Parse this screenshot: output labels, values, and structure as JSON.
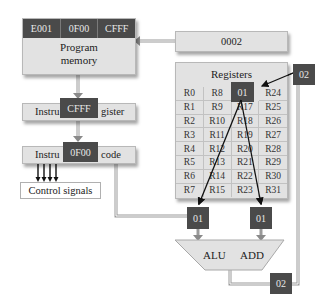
{
  "program_memory": {
    "cells": [
      "E001",
      "0F00",
      "CFFF"
    ],
    "label_line1": "Program",
    "label_line2": "memory"
  },
  "program_counter": {
    "value": "0002"
  },
  "instruction_register": {
    "label_left": "Instru",
    "label_right": "gister",
    "value": "CFFF"
  },
  "instruction_decode": {
    "label_left": "Instru",
    "label_right": "code",
    "value": "0F00"
  },
  "control_signals": {
    "label": "Control signals"
  },
  "registers": {
    "title": "Registers",
    "cells": [
      "R0",
      "R8",
      "01",
      "R24",
      "R1",
      "R9",
      "R17",
      "R25",
      "R2",
      "R10",
      "R18",
      "R26",
      "R3",
      "R11",
      "R19",
      "R27",
      "R4",
      "R12",
      "R20",
      "R28",
      "R5",
      "R13",
      "R21",
      "R29",
      "R6",
      "R14",
      "R22",
      "R30",
      "R7",
      "R15",
      "R23",
      "R31"
    ],
    "highlighted_value": "01"
  },
  "register_select": {
    "value": "02"
  },
  "alu": {
    "label": "ALU",
    "operation": "ADD",
    "operand_a": "01",
    "operand_b": "01",
    "result": "02"
  },
  "colors": {
    "dark_box": "#4a4a4a",
    "light_box": "#e2e2e2",
    "line": "#888888"
  }
}
